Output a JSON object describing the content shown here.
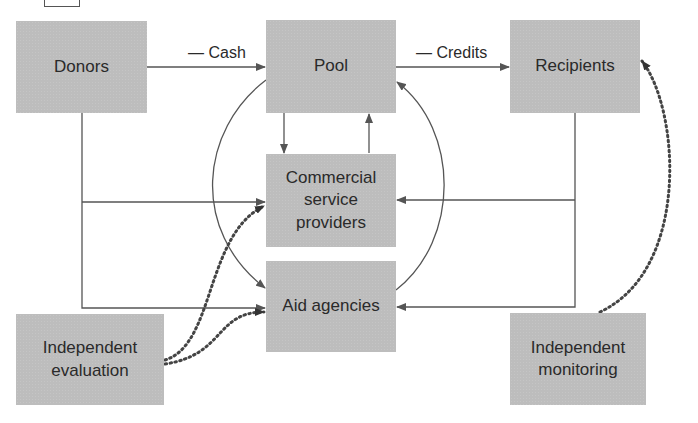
{
  "diagram": {
    "nodes": {
      "donors": {
        "label": "Donors"
      },
      "pool": {
        "label": "Pool"
      },
      "recipients": {
        "label": "Recipients"
      },
      "commercial": {
        "label": "Commercial\nservice\nproviders"
      },
      "aid": {
        "label": "Aid agencies"
      },
      "evaluation": {
        "label": "Independent\nevaluation"
      },
      "monitoring": {
        "label": "Independent\nmonitoring"
      }
    },
    "edges": {
      "cash": {
        "label": "— Cash"
      },
      "credits": {
        "label": "— Credits"
      }
    },
    "colors": {
      "node_fill": "#bdbdbd",
      "line": "#555555",
      "text": "#2a2a2a"
    }
  }
}
